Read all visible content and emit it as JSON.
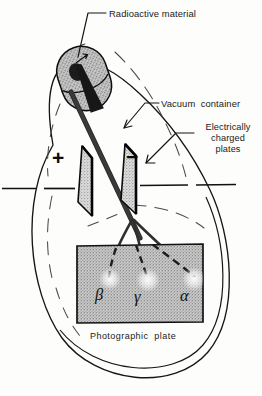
{
  "figure": {
    "width": 262,
    "height": 396,
    "background_color": "#fdfdfc",
    "ink_color": "#111111"
  },
  "labels": {
    "radioactive_material": "Radioactive material",
    "vacuum_container": "Vacuum  container",
    "charged_plates": "Electrically\ncharged\nplates",
    "photographic_plate": "Photographic  plate"
  },
  "plates": {
    "positive_sign": "+",
    "negative_sign": "−",
    "positive_name": "positive charged plate",
    "negative_name": "negative charged plate",
    "fill_color": "#d8d8d8",
    "edge_color": "#0b0b0b"
  },
  "rays": [
    {
      "symbol": "β",
      "name": "beta",
      "deflection": "toward positive plate",
      "impact_x": 110,
      "impact_y": 277
    },
    {
      "symbol": "γ",
      "name": "gamma",
      "deflection": "undeflected",
      "impact_x": 148,
      "impact_y": 278
    },
    {
      "symbol": "α",
      "name": "alpha",
      "deflection": "toward negative plate",
      "impact_x": 194,
      "impact_y": 277
    }
  ],
  "source": {
    "name": "lead shield capsule with radioactive sample",
    "fill_color": "#b9b9b9",
    "cavity_color": "#1c1c1c"
  },
  "photographic_plate": {
    "name": "photographic plate",
    "fill_color": "#c9c9c9",
    "border_color": "#121212"
  },
  "vacuum_container": {
    "name": "vacuum container outline",
    "stroke_color": "#161616"
  },
  "electrode_wire": {
    "name": "electrode lead wire",
    "stroke_color": "#111111"
  }
}
